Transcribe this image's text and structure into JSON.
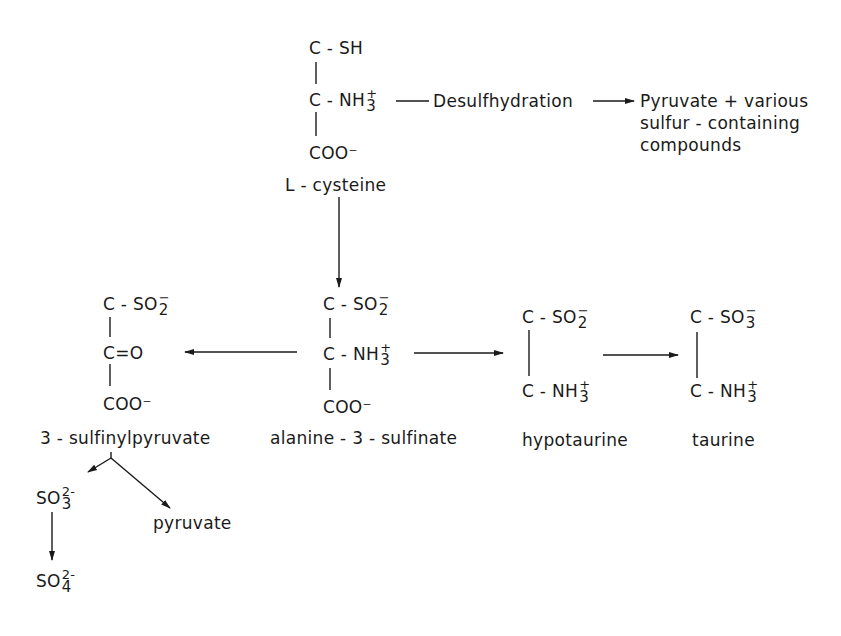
{
  "diagram": {
    "type": "metabolic pathway"
  },
  "molecules": {
    "cysteine": {
      "line1": "C - SH",
      "line2_base": "C - NH",
      "line2_sub": "3",
      "line2_sup": "+",
      "line3": "COO⁻",
      "name": "L - cysteine"
    },
    "alanine_sulfinate": {
      "line1_base": "C - SO",
      "line1_sub": "2",
      "line1_sup": "−",
      "line2_base": "C - NH",
      "line2_sub": "3",
      "line2_sup": "+",
      "line3": "COO⁻",
      "name": "alanine - 3 - sulfinate"
    },
    "sulfinylpyruvate": {
      "line1_base": "C - SO",
      "line1_sub": "2",
      "line1_sup": "−",
      "line2": "C=O",
      "line3": "COO⁻",
      "name": "3 - sulfinylpyruvate"
    },
    "hypotaurine": {
      "line1_base": "C - SO",
      "line1_sub": "2",
      "line1_sup": "−",
      "line2_base": "C - NH",
      "line2_sub": "3",
      "line2_sup": "+",
      "name": "hypotaurine"
    },
    "taurine": {
      "line1_base": "C - SO",
      "line1_sub": "3",
      "line1_sup": "−",
      "line2_base": "C - NH",
      "line2_sub": "3",
      "line2_sup": "+",
      "name": "taurine"
    },
    "sulfite": {
      "base": "SO",
      "sub": "3",
      "sup": "2-"
    },
    "sulfate": {
      "base": "SO",
      "sub": "4",
      "sup": "2-"
    },
    "pyruvate": {
      "name": "pyruvate"
    }
  },
  "reactions": {
    "desulfhydration_label": "Desulfhydration",
    "desulfhydration_products": [
      "Pyruvate + various",
      "sulfur - containing",
      "compounds"
    ]
  },
  "edges": [
    {
      "from": "L-cysteine",
      "to": "desulfhydration products",
      "via": "Desulfhydration"
    },
    {
      "from": "L-cysteine",
      "to": "alanine-3-sulfinate"
    },
    {
      "from": "alanine-3-sulfinate",
      "to": "3-sulfinylpyruvate"
    },
    {
      "from": "alanine-3-sulfinate",
      "to": "hypotaurine"
    },
    {
      "from": "hypotaurine",
      "to": "taurine"
    },
    {
      "from": "3-sulfinylpyruvate",
      "to": "SO3 2-"
    },
    {
      "from": "3-sulfinylpyruvate",
      "to": "pyruvate"
    },
    {
      "from": "SO3 2-",
      "to": "SO4 2-"
    }
  ],
  "colors": {
    "ink": "#1a1a1a",
    "background": "#ffffff"
  }
}
